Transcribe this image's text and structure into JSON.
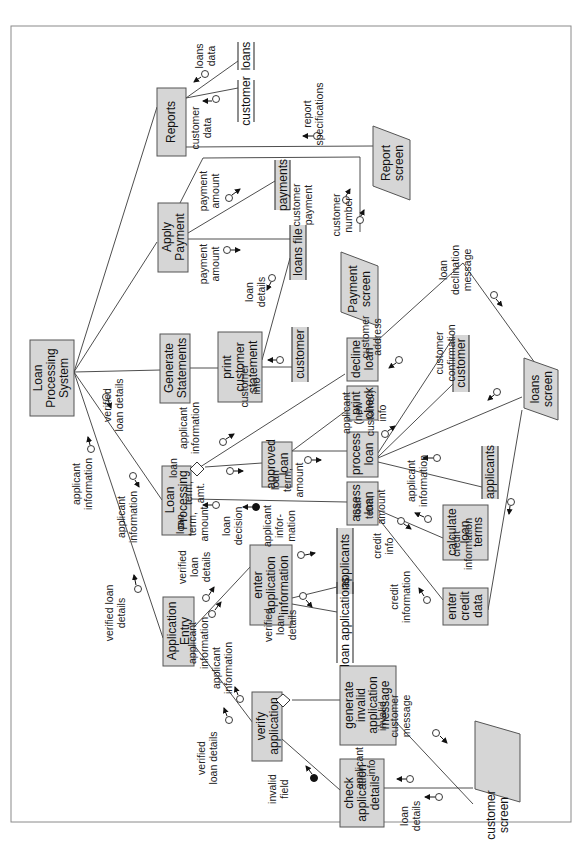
{
  "diagram": {
    "type": "structure_chart",
    "orientation": "rotated-90-ccw",
    "colors": {
      "module_fill": "#d6d6d6",
      "module_border": "#555555",
      "line": "#3a3a3a",
      "background": "#ffffff"
    },
    "modules": {
      "root": "Loan Processing System",
      "reports": "Reports",
      "apply_payment": "Apply Payment",
      "generate_statements": "Generate Statements",
      "loan_processing": "Loan Processing",
      "application_entry": "Application Entry",
      "print_customer_statement": "print customer statement",
      "decline_loan": "decline loan",
      "print_check": "print check",
      "approved_loan": "approved loan",
      "process_loan": "process loan",
      "assess_loan": "assess loan",
      "calculate_loan_terms": "calculate loan terms",
      "enter_credit_data": "enter credit data",
      "enter_application_information": "enter application information",
      "verify_application": "verify application",
      "generate_invalid_application_message": "generate invalid application message",
      "check_application_details": "check application details"
    },
    "screens": {
      "report_screen": "Report screen",
      "payment_screen": "Payment screen",
      "loans_screen": "loans screen",
      "customer_screen": "customer screen"
    },
    "data_stores": {
      "loans": "loans",
      "customer_top": "customer",
      "payments": "payments",
      "loans_file": "loans file",
      "customer_mid": "customer",
      "customer_right": "customer",
      "applicants_right": "applicants",
      "applicants_mid": "applicants",
      "loan_applications": "loan applications"
    },
    "couples": {
      "loans_data": "loans data",
      "customer_data": "customer data",
      "report_specifications": "report specifications",
      "payment_amount_1": "payment amount",
      "payment_amount_2": "payment amount",
      "customer_payment": "customer payment",
      "customer_number": "customer number",
      "loan_details_1": "loan details",
      "loan_declination_message": "loan declination message",
      "customer_info": "customer info",
      "customer_address": "customer address",
      "customer_confirmation": "customer confirmation",
      "applicant_new_customer_info": "applicant (new customer) info",
      "verified_loan_details_1": "verified loan details",
      "applicant_information_1": "applicant information",
      "applicant_information_2": "applicant information",
      "applicant_information_3": "applicant information",
      "applicant_information_4": "applicant information",
      "loan_term_amt": "loan term, amt.",
      "loan_term_amount_1": "loan term, amount",
      "loan_term_amount_2": "loan term, amount",
      "loan_term_amount_3": "loan term, amount",
      "loan_decision": "loan decision",
      "applicant_information_5": "applicant infor- mation",
      "credit_info": "credit info",
      "credit_information_1": "credit information",
      "credit_information_2": "credit information",
      "verified_loan_details_2": "verified loan details",
      "verified_loan_details_3": "verified loan details",
      "verified_loan_details_4": "verified loan details",
      "applicant_information_6": "applicant information",
      "applicant_information_7": "applicant information",
      "verified_loan_details_5": "verified loan details",
      "invalid_field": "invalid field",
      "invalid_customer_message": "invalid customer message",
      "applicant_info": "applicant info",
      "loan_details_2": "loan details"
    }
  }
}
